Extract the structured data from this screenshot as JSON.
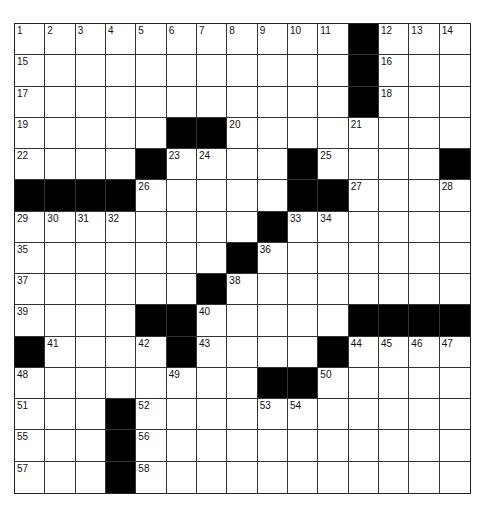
{
  "puzzle": {
    "rows": 15,
    "cols": 15,
    "layout": [
      "...........#...",
      "...........#...",
      "...........#...",
      ".....##........",
      "....#....#....#",
      "####.....##....",
      "........#......",
      ".......#.......",
      "......#........",
      "....##.....####",
      "#....#....#....",
      "........##.....",
      "...#...........",
      "...#...........",
      "...#..........."
    ],
    "numbers": [
      {
        "r": 0,
        "c": 0,
        "n": 1
      },
      {
        "r": 0,
        "c": 1,
        "n": 2
      },
      {
        "r": 0,
        "c": 2,
        "n": 3
      },
      {
        "r": 0,
        "c": 3,
        "n": 4
      },
      {
        "r": 0,
        "c": 4,
        "n": 5
      },
      {
        "r": 0,
        "c": 5,
        "n": 6
      },
      {
        "r": 0,
        "c": 6,
        "n": 7
      },
      {
        "r": 0,
        "c": 7,
        "n": 8
      },
      {
        "r": 0,
        "c": 8,
        "n": 9
      },
      {
        "r": 0,
        "c": 9,
        "n": 10
      },
      {
        "r": 0,
        "c": 10,
        "n": 11
      },
      {
        "r": 0,
        "c": 12,
        "n": 12
      },
      {
        "r": 0,
        "c": 13,
        "n": 13
      },
      {
        "r": 0,
        "c": 14,
        "n": 14
      },
      {
        "r": 1,
        "c": 0,
        "n": 15
      },
      {
        "r": 1,
        "c": 12,
        "n": 16
      },
      {
        "r": 2,
        "c": 0,
        "n": 17
      },
      {
        "r": 2,
        "c": 12,
        "n": 18
      },
      {
        "r": 3,
        "c": 0,
        "n": 19
      },
      {
        "r": 3,
        "c": 7,
        "n": 20
      },
      {
        "r": 3,
        "c": 11,
        "n": 21
      },
      {
        "r": 4,
        "c": 0,
        "n": 22
      },
      {
        "r": 4,
        "c": 5,
        "n": 23
      },
      {
        "r": 4,
        "c": 6,
        "n": 24
      },
      {
        "r": 4,
        "c": 10,
        "n": 25
      },
      {
        "r": 5,
        "c": 4,
        "n": 26
      },
      {
        "r": 5,
        "c": 11,
        "n": 27
      },
      {
        "r": 5,
        "c": 14,
        "n": 28
      },
      {
        "r": 6,
        "c": 0,
        "n": 29
      },
      {
        "r": 6,
        "c": 1,
        "n": 30
      },
      {
        "r": 6,
        "c": 2,
        "n": 31
      },
      {
        "r": 6,
        "c": 3,
        "n": 32
      },
      {
        "r": 6,
        "c": 9,
        "n": 33
      },
      {
        "r": 6,
        "c": 10,
        "n": 34
      },
      {
        "r": 7,
        "c": 0,
        "n": 35
      },
      {
        "r": 7,
        "c": 8,
        "n": 36
      },
      {
        "r": 8,
        "c": 0,
        "n": 37
      },
      {
        "r": 8,
        "c": 7,
        "n": 38
      },
      {
        "r": 9,
        "c": 0,
        "n": 39
      },
      {
        "r": 9,
        "c": 6,
        "n": 40
      },
      {
        "r": 10,
        "c": 1,
        "n": 41
      },
      {
        "r": 10,
        "c": 4,
        "n": 42
      },
      {
        "r": 10,
        "c": 6,
        "n": 43
      },
      {
        "r": 10,
        "c": 11,
        "n": 44
      },
      {
        "r": 10,
        "c": 12,
        "n": 45
      },
      {
        "r": 10,
        "c": 13,
        "n": 46
      },
      {
        "r": 10,
        "c": 14,
        "n": 47
      },
      {
        "r": 11,
        "c": 0,
        "n": 48
      },
      {
        "r": 11,
        "c": 5,
        "n": 49
      },
      {
        "r": 11,
        "c": 10,
        "n": 50
      },
      {
        "r": 12,
        "c": 0,
        "n": 51
      },
      {
        "r": 12,
        "c": 4,
        "n": 52
      },
      {
        "r": 12,
        "c": 8,
        "n": 53
      },
      {
        "r": 12,
        "c": 9,
        "n": 54
      },
      {
        "r": 13,
        "c": 0,
        "n": 55
      },
      {
        "r": 13,
        "c": 4,
        "n": 56
      },
      {
        "r": 14,
        "c": 0,
        "n": 57
      },
      {
        "r": 14,
        "c": 4,
        "n": 58
      }
    ],
    "entries": {}
  },
  "colors": {
    "black_square": "#000000",
    "white_square": "#ffffff",
    "grid_line": "#333333"
  }
}
